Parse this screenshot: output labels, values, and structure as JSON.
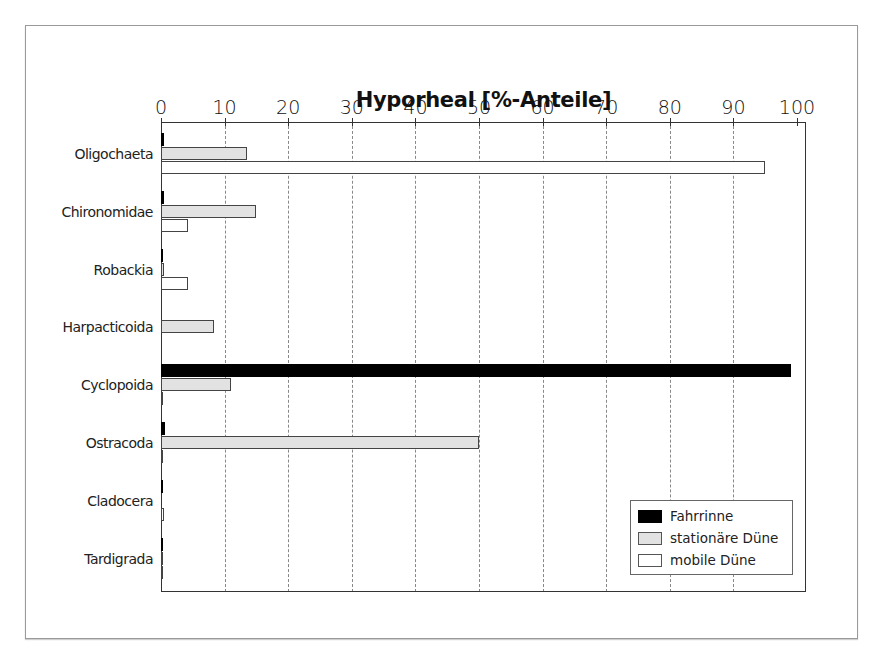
{
  "chart_data": {
    "type": "bar",
    "orientation": "horizontal",
    "title": "Hyporheal [%-Anteile]",
    "xlabel": "",
    "ylabel": "",
    "xlim": [
      0,
      100
    ],
    "x_ticks": [
      "0",
      "10",
      "20",
      "30",
      "40",
      "50",
      "60",
      "70",
      "80",
      "90",
      "100"
    ],
    "x_axis_position": "top",
    "grid": "vertical dashed",
    "legend_position": "lower right (inside)",
    "categories": [
      "Oligochaeta",
      "Chironomidae",
      "Robackia",
      "Harpacticoida",
      "Cyclopoida",
      "Ostracoda",
      "Cladocera",
      "Tardigrada"
    ],
    "series": [
      {
        "name": "Fahrrinne",
        "color": "#000000",
        "values": [
          0.4,
          0.4,
          0.2,
          0,
          99,
          0.6,
          0.2,
          0.3
        ]
      },
      {
        "name": "stationäre Düne",
        "color": "#e2e2e2",
        "values": [
          13.5,
          15,
          0.5,
          8.3,
          11,
          50,
          0,
          0.3
        ]
      },
      {
        "name": "mobile Düne",
        "color": "#ffffff",
        "values": [
          95,
          4.2,
          4.2,
          0,
          0.3,
          0.3,
          0.4,
          0.2
        ]
      }
    ]
  },
  "legend": {
    "items": [
      {
        "label": "Fahrrinne"
      },
      {
        "label": "stationäre Düne"
      },
      {
        "label": "mobile Düne"
      }
    ]
  }
}
